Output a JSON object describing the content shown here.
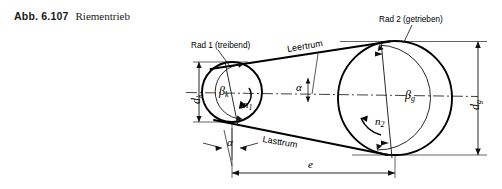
{
  "figure": {
    "number": "Abb. 6.107",
    "title": "Riementrieb"
  },
  "labels": {
    "wheel1": "Rad 1 (treibend)",
    "wheel2": "Rad 2 (getrieben)",
    "slack_span": "Leertrum",
    "tight_span": "Lasttrum",
    "beta_k": "β",
    "beta_k_sub": "k",
    "beta_g": "β",
    "beta_g_sub": "g",
    "n1": "n",
    "n1_sub": "1",
    "n2": "n",
    "n2_sub": "2",
    "d_k": "d",
    "d_k_sub": "k",
    "d_g": "d",
    "d_g_sub": "g",
    "alpha_top": "α",
    "alpha_bottom": "α",
    "center_distance": "e"
  },
  "colors": {
    "line": "#000000",
    "thin": "#1a1a1a",
    "background": "#ffffff",
    "text": "#1a1a1a"
  },
  "diagram_geometry": {
    "type": "engineering-drawing",
    "small_pulley": {
      "cx": 232,
      "cy": 92,
      "r_outer": 30,
      "r_inner": 20,
      "label": "Rad 1 (treibend)"
    },
    "large_pulley": {
      "cx": 395,
      "cy": 98,
      "r_outer": 57,
      "r_inner": 38,
      "label": "Rad 2 (getrieben)"
    },
    "center_distance_px": 163,
    "belt_angle_label": "α",
    "centerline": "dash-dot horizontal through both pulley centers"
  }
}
